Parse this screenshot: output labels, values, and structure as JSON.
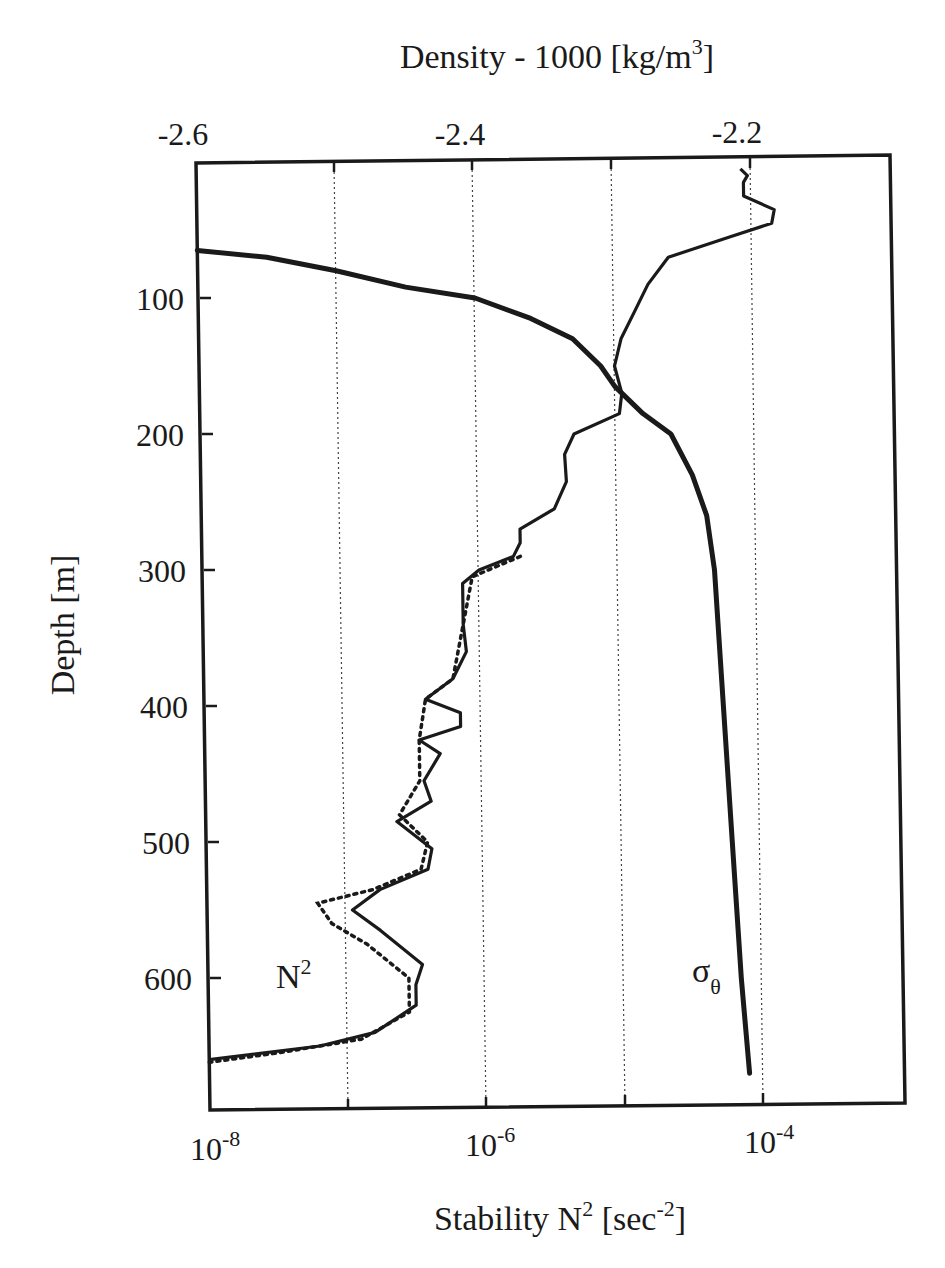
{
  "chart_data": {
    "type": "line",
    "title": "",
    "top_axis": {
      "label": "Density - 1000 [kg/m3]",
      "label_main": "Density - 1000  [kg/m",
      "label_sup": "3",
      "label_end": "]",
      "ticks": [
        -2.6,
        -2.4,
        -2.2
      ],
      "tick_labels": [
        "-2.6",
        "-2.4",
        "-2.2"
      ],
      "range": [
        -2.6,
        -2.1
      ]
    },
    "bottom_axis": {
      "label": "Stability N2 [sec-2]",
      "label_main": "Stability  N",
      "label_sup1": "2",
      "label_mid": " [sec",
      "label_sup2": "-2",
      "label_end": "]",
      "scale": "log",
      "range": [
        1e-08,
        0.001
      ],
      "ticks": [
        1e-08,
        1e-07,
        1e-06,
        1e-05,
        0.0001,
        0.001
      ],
      "tick_labels": [
        {
          "base": "10",
          "exp": "-8"
        },
        {
          "base": "10",
          "exp": "-6"
        },
        {
          "base": "10",
          "exp": "-4"
        }
      ],
      "grid": "dotted vertical at each decade"
    },
    "y_axis": {
      "label": "Depth  [m]",
      "inverted": true,
      "range": [
        0,
        700
      ],
      "ticks": [
        100,
        200,
        300,
        400,
        500,
        600
      ],
      "tick_labels": [
        "100",
        "200",
        "300",
        "400",
        "500",
        "600"
      ]
    },
    "series": [
      {
        "name": "sigma_theta",
        "label": "σθ",
        "label_main": "σ",
        "label_sub": "θ",
        "axis": "top",
        "style": "thick solid",
        "points_depth_density": [
          [
            65,
            -2.6
          ],
          [
            70,
            -2.55
          ],
          [
            80,
            -2.5
          ],
          [
            92,
            -2.45
          ],
          [
            100,
            -2.4
          ],
          [
            115,
            -2.36
          ],
          [
            130,
            -2.33
          ],
          [
            150,
            -2.31
          ],
          [
            165,
            -2.3
          ],
          [
            185,
            -2.28
          ],
          [
            200,
            -2.26
          ],
          [
            230,
            -2.245
          ],
          [
            260,
            -2.235
          ],
          [
            300,
            -2.23
          ],
          [
            400,
            -2.225
          ],
          [
            500,
            -2.22
          ],
          [
            600,
            -2.215
          ],
          [
            670,
            -2.21
          ]
        ]
      },
      {
        "name": "N2_solid",
        "label": "N2",
        "axis": "bottom",
        "style": "solid",
        "points_depth_log10N2": [
          [
            5,
            -4.07
          ],
          [
            10,
            -4.02
          ],
          [
            15,
            -4.05
          ],
          [
            25,
            -4.05
          ],
          [
            35,
            -3.83
          ],
          [
            45,
            -3.85
          ],
          [
            55,
            -4.15
          ],
          [
            70,
            -4.6
          ],
          [
            90,
            -4.75
          ],
          [
            110,
            -4.85
          ],
          [
            130,
            -4.95
          ],
          [
            150,
            -5.0
          ],
          [
            170,
            -4.95
          ],
          [
            185,
            -4.97
          ],
          [
            200,
            -5.3
          ],
          [
            215,
            -5.37
          ],
          [
            235,
            -5.36
          ],
          [
            255,
            -5.45
          ],
          [
            270,
            -5.7
          ],
          [
            280,
            -5.7
          ],
          [
            290,
            -5.75
          ],
          [
            300,
            -6.0
          ],
          [
            310,
            -6.12
          ],
          [
            340,
            -6.12
          ],
          [
            360,
            -6.1
          ],
          [
            380,
            -6.2
          ],
          [
            395,
            -6.4
          ],
          [
            405,
            -6.15
          ],
          [
            415,
            -6.15
          ],
          [
            425,
            -6.45
          ],
          [
            435,
            -6.3
          ],
          [
            455,
            -6.42
          ],
          [
            470,
            -6.37
          ],
          [
            485,
            -6.62
          ],
          [
            505,
            -6.37
          ],
          [
            520,
            -6.4
          ],
          [
            535,
            -6.75
          ],
          [
            550,
            -6.95
          ],
          [
            565,
            -6.75
          ],
          [
            590,
            -6.45
          ],
          [
            605,
            -6.5
          ],
          [
            620,
            -6.5
          ],
          [
            640,
            -6.8
          ],
          [
            650,
            -7.2
          ],
          [
            660,
            -8.0
          ]
        ]
      },
      {
        "name": "N2_dotted",
        "axis": "bottom",
        "style": "dotted",
        "points_depth_log10N2": [
          [
            290,
            -5.7
          ],
          [
            305,
            -6.05
          ],
          [
            340,
            -6.12
          ],
          [
            380,
            -6.2
          ],
          [
            395,
            -6.4
          ],
          [
            425,
            -6.45
          ],
          [
            455,
            -6.45
          ],
          [
            480,
            -6.6
          ],
          [
            500,
            -6.4
          ],
          [
            520,
            -6.45
          ],
          [
            535,
            -6.8
          ],
          [
            545,
            -7.2
          ],
          [
            560,
            -7.1
          ],
          [
            575,
            -6.85
          ],
          [
            600,
            -6.55
          ],
          [
            625,
            -6.55
          ],
          [
            645,
            -6.9
          ],
          [
            655,
            -7.5
          ],
          [
            662,
            -8.0
          ]
        ]
      }
    ],
    "annotations": [
      {
        "text": "N2",
        "near_depth": 600,
        "near_x": "1e-7.5"
      },
      {
        "text": "σθ",
        "near_depth": 610,
        "near_x": "1e-4.5"
      }
    ],
    "legend": "none (inline labels)"
  }
}
